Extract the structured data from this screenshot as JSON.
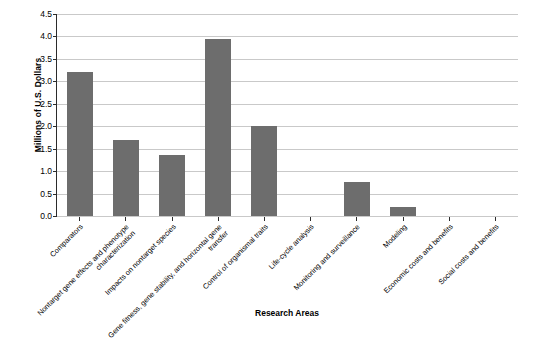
{
  "chart_data": {
    "type": "bar",
    "title": "",
    "xlabel": "Research Areas",
    "ylabel": "Millions of U.S. Dollars",
    "ylim": [
      0.0,
      4.5
    ],
    "ytick_step": 0.5,
    "ytick_labels": [
      "0.0",
      "0.5",
      "1.0",
      "1.5",
      "2.0",
      "2.5",
      "3.0",
      "3.5",
      "4.0",
      "4.5"
    ],
    "grid": true,
    "legend": "none",
    "bar_color": "#6d6d6d",
    "categories": [
      "Comparators",
      "Nontarget gene effects and phenotype characterization",
      "Impacts on nontarget species",
      "Gene fitness, gene stability, and horizontal gene transfer",
      "Control of organismal traits",
      "Life-cycle analysis",
      "Monitoring and surveillance",
      "Modeling",
      "Economic costs and benefits",
      "Social costs and benefits"
    ],
    "values": [
      3.2,
      1.7,
      1.35,
      3.95,
      2.0,
      0.0,
      0.75,
      0.2,
      0.0,
      0.0
    ]
  }
}
